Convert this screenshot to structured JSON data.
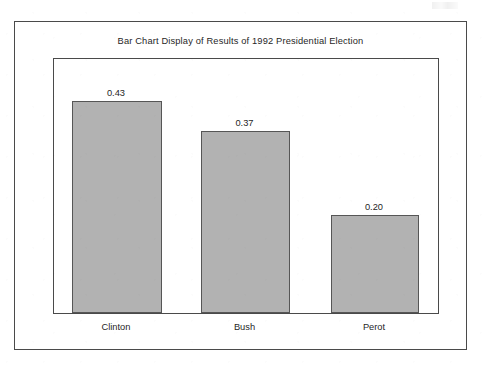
{
  "figure": {
    "title": "Bar Chart Display of Results of 1992 Presidential Election"
  },
  "chart_data": {
    "type": "bar",
    "title": "Bar Chart Display of Results of 1992 Presidential Election",
    "xlabel": "",
    "ylabel": "",
    "categories": [
      "Clinton",
      "Bush",
      "Perot"
    ],
    "values": [
      0.43,
      0.37,
      0.2
    ],
    "value_labels": [
      "0.43",
      "0.37",
      "0.20"
    ],
    "ylim": [
      0,
      0.52
    ],
    "grid": false,
    "legend": null,
    "bar_color": "#b2b2b2",
    "bar_edge_color": "#565656",
    "frame_color": "#4a4a4a",
    "background": "#ffffff"
  }
}
